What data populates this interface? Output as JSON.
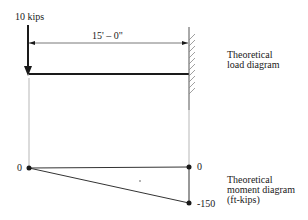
{
  "load": {
    "force_label": "10 kips",
    "span_label": "15' – 0\"",
    "caption": [
      "Theoretical",
      "load diagram"
    ]
  },
  "moment": {
    "left_value": "0",
    "right_top_value": "0",
    "right_bottom_value": "-150",
    "caption": [
      "Theoretical",
      "moment diagram",
      "(ft-kips)"
    ]
  },
  "colors": {
    "line": "#1a1a1a",
    "thin": "#555555",
    "hatch": "#888888"
  }
}
